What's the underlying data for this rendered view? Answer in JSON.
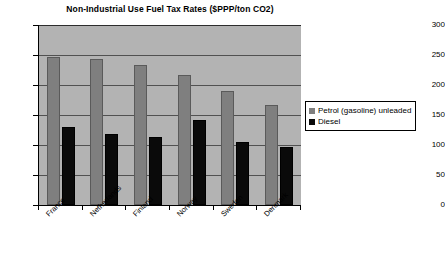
{
  "chart_data": {
    "type": "bar",
    "title": "Non-Industrial Use Fuel Tax Rates ($PPP/ton CO2)",
    "xlabel": "",
    "ylabel": "",
    "ylim": [
      0,
      300
    ],
    "yticks": [
      0,
      50,
      100,
      150,
      200,
      250,
      300
    ],
    "ytick_labels": [
      "0",
      "50",
      "100",
      "150",
      "200",
      "250",
      "300"
    ],
    "grid": true,
    "legend_position": "right",
    "categories": [
      "France",
      "Netherlands",
      "Finland",
      "Norway",
      "Sweden",
      "Denmark"
    ],
    "series": [
      {
        "name": "Petrol (gasoline) unleaded",
        "color": "#7f7f7f",
        "values": [
          247,
          243,
          233,
          217,
          190,
          167
        ]
      },
      {
        "name": "Diesel",
        "color": "#0a0a0a",
        "values": [
          130,
          118,
          114,
          142,
          105,
          97
        ]
      }
    ]
  },
  "legend": {
    "items": [
      {
        "label": "Petrol (gasoline) unleaded"
      },
      {
        "label": "Diesel"
      }
    ]
  }
}
